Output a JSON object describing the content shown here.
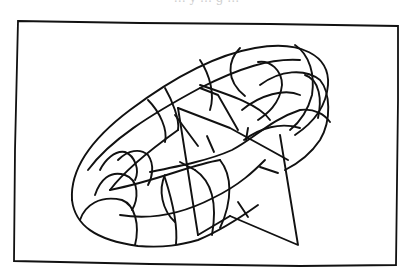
{
  "figure": {
    "caption_cropped": "… y … g …",
    "elements": [
      "frame",
      "torus",
      "torus-grid-lines",
      "triangular-plane",
      "normal-ticks"
    ],
    "colors": {
      "ink": "#111111",
      "background": "#ffffff"
    }
  }
}
